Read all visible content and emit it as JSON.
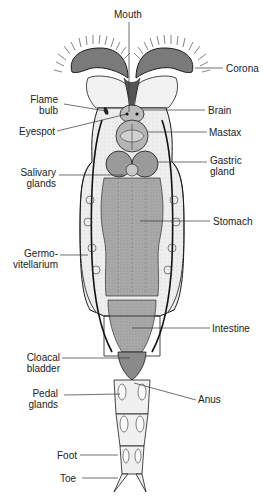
{
  "figure": {
    "colors": {
      "body_fill": "#ececec",
      "gut_fill": "#a8a8a8",
      "outline": "#1a1a1a",
      "leader": "#333333",
      "label_text": "#222222"
    }
  },
  "labels": {
    "mouth": "Mouth",
    "corona": "Corona",
    "flame_bulb_1": "Flame",
    "flame_bulb_2": "bulb",
    "brain": "Brain",
    "eyespot": "Eyespot",
    "mastax": "Mastax",
    "salivary_1": "Salivary",
    "salivary_2": "glands",
    "gastric_1": "Gastric",
    "gastric_2": "gland",
    "stomach": "Stomach",
    "germo_1": "Germo-",
    "germo_2": "vitellarium",
    "intestine": "Intestine",
    "cloacal_1": "Cloacal",
    "cloacal_2": "bladder",
    "anus": "Anus",
    "pedal_1": "Pedal",
    "pedal_2": "glands",
    "foot": "Foot",
    "toe": "Toe"
  }
}
